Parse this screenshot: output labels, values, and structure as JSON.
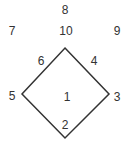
{
  "diagram": {
    "shape": "diamond",
    "stroke_color": "#333333",
    "vertices": {
      "top": [
        65,
        48
      ],
      "right": [
        109,
        94
      ],
      "bottom": [
        65,
        138
      ],
      "left": [
        22,
        94
      ]
    },
    "labels": [
      {
        "id": "8",
        "text": "8",
        "x": 65,
        "y": 10
      },
      {
        "id": "7",
        "text": "7",
        "x": 12,
        "y": 31
      },
      {
        "id": "10",
        "text": "10",
        "x": 66,
        "y": 31
      },
      {
        "id": "9",
        "text": "9",
        "x": 117,
        "y": 31
      },
      {
        "id": "6",
        "text": "6",
        "x": 41,
        "y": 61
      },
      {
        "id": "4",
        "text": "4",
        "x": 94,
        "y": 61
      },
      {
        "id": "5",
        "text": "5",
        "x": 12,
        "y": 96
      },
      {
        "id": "1",
        "text": "1",
        "x": 67,
        "y": 97
      },
      {
        "id": "3",
        "text": "3",
        "x": 117,
        "y": 97
      },
      {
        "id": "2",
        "text": "2",
        "x": 65,
        "y": 125
      }
    ]
  }
}
